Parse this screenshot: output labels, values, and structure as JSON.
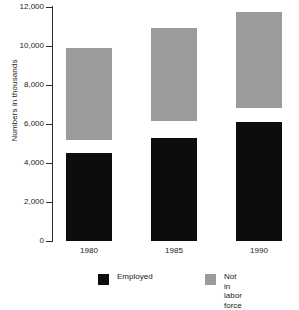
{
  "chart_data": {
    "type": "bar",
    "subtype": "stacked-bar",
    "title": "",
    "xlabel": "",
    "ylabel": "Numbers in thousands",
    "categories": [
      "1980",
      "1985",
      "1990"
    ],
    "series": [
      {
        "name": "Employed",
        "color": "#0d0d0d",
        "values": [
          4500,
          5300,
          6100
        ]
      },
      {
        "name": "Unemployed",
        "color": "#ffffff",
        "values": [
          700,
          850,
          700
        ],
        "legend_shown": false
      },
      {
        "name": "Not in labor force",
        "color": "#9b9b9b",
        "values": [
          4700,
          4750,
          4950
        ]
      }
    ],
    "totals": [
      9900,
      10900,
      11750
    ],
    "ylim": [
      0,
      12000
    ],
    "ytick_step": 2000,
    "ytick_labels": [
      "12,000",
      "10,000",
      "8,000",
      "6,000",
      "4,000",
      "2,000",
      "0"
    ],
    "ytick_values": [
      12000,
      10000,
      8000,
      6000,
      4000,
      2000,
      0
    ],
    "grid": false,
    "legend_position": "bottom"
  },
  "axes": {
    "y_title": "Numbers in thousands"
  },
  "legend": {
    "items": [
      {
        "label": "Employed",
        "color": "#0d0d0d"
      },
      {
        "label": "Not in labor\nforce",
        "color": "#9b9b9b"
      }
    ]
  }
}
